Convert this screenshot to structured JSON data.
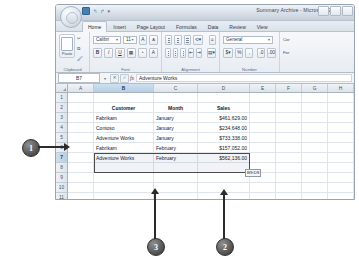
{
  "window": {
    "title": "Summary Archive - Microsoft Excel",
    "quick_access": [
      "save-icon",
      "undo-icon",
      "redo-icon",
      "customize-icon"
    ],
    "office_button": "office-orb"
  },
  "ribbon": {
    "tabs": [
      {
        "label": "Home",
        "active": true
      },
      {
        "label": "Insert",
        "active": false
      },
      {
        "label": "Page Layout",
        "active": false
      },
      {
        "label": "Formulas",
        "active": false
      },
      {
        "label": "Data",
        "active": false
      },
      {
        "label": "Review",
        "active": false
      },
      {
        "label": "View",
        "active": false
      }
    ],
    "groups": [
      {
        "name": "Clipboard",
        "label": "Clipboard"
      },
      {
        "name": "Font",
        "label": "Font"
      },
      {
        "name": "Alignment",
        "label": "Alignment"
      },
      {
        "name": "Number",
        "label": "Number"
      },
      {
        "name": "Styles",
        "label": ""
      }
    ],
    "clipboard": {
      "paste_label": "Paste"
    },
    "font": {
      "name": "Calibri",
      "size": "11",
      "bold": "B",
      "italic": "I",
      "underline": "U",
      "grow": "A",
      "shrink": "A"
    },
    "number": {
      "format": "General",
      "currency": "$",
      "percent": "%",
      "comma": ","
    },
    "styles": {
      "cond_label_line1": "Cor",
      "cond_label_line2": "For"
    }
  },
  "formula_bar": {
    "name_box": "B7",
    "cancel": "cancel-icon",
    "accept": "accept-icon",
    "fx": "fx",
    "content": "Adventure Works"
  },
  "sheet": {
    "columns": [
      "A",
      "B",
      "C",
      "D",
      "E",
      "F",
      "G",
      "H"
    ],
    "selected_column": "B",
    "rows": [
      "1",
      "2",
      "3",
      "4",
      "5",
      "6",
      "7",
      "8",
      "9",
      "10",
      "11",
      "12"
    ],
    "selected_row": "7",
    "headers": {
      "customer": "Customer",
      "month": "Month",
      "sales": "Sales"
    },
    "data": [
      {
        "row": "2",
        "customer": "Customer",
        "month": "Month",
        "sales": "Sales",
        "header": true
      },
      {
        "row": "3",
        "customer": "Fabrikam",
        "month": "January",
        "sales": "$461,629.00",
        "header": false
      },
      {
        "row": "4",
        "customer": "Contoso",
        "month": "January",
        "sales": "$234,648.00",
        "header": false
      },
      {
        "row": "5",
        "customer": "Adventure Works",
        "month": "January",
        "sales": "$733,338.00",
        "header": false
      },
      {
        "row": "6",
        "customer": "Fabrikam",
        "month": "February",
        "sales": "$157,052.00",
        "header": false
      },
      {
        "row": "7",
        "customer": "Adventure Works",
        "month": "February",
        "sales": "$562,136.00",
        "header": false
      }
    ],
    "drop_tooltip": "B9:D9"
  },
  "callouts": [
    {
      "number": "1",
      "target": "selected-row-7"
    },
    {
      "number": "2",
      "target": "drop-tooltip"
    },
    {
      "number": "3",
      "target": "month-column"
    }
  ]
}
